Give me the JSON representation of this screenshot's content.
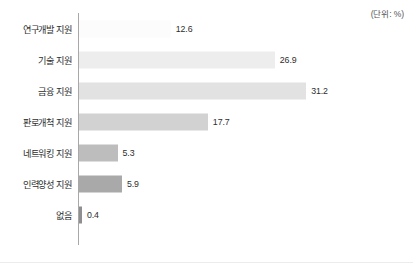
{
  "unit_note": "(단위: %)",
  "chart_data": {
    "type": "bar",
    "orientation": "horizontal",
    "title": "",
    "subtitle": "",
    "xlabel": "",
    "ylabel": "",
    "unit": "%",
    "unit_note": "(단위: %)",
    "grid": false,
    "legend": "none",
    "axis_ticks": [],
    "xlim": [
      0,
      31.2
    ],
    "categories": [
      "연구개발 지원",
      "기술 지원",
      "금융 지원",
      "판로개척 지원",
      "네트워킹 지원",
      "인력양성 지원",
      "없음"
    ],
    "values": [
      12.6,
      26.9,
      31.2,
      17.7,
      5.3,
      5.9,
      0.4
    ],
    "value_labels": [
      "12.6",
      "26.9",
      "31.2",
      "17.7",
      "5.3",
      "5.9",
      "0.4"
    ],
    "bar_colors": [
      "#fcfcfc",
      "#ededed",
      "#e2e2e2",
      "#d2d2d2",
      "#bdbdbd",
      "#a9a9a9",
      "#8f8f8f"
    ],
    "px_per_unit": 7.28,
    "axis_color": "#a8a8a8"
  }
}
